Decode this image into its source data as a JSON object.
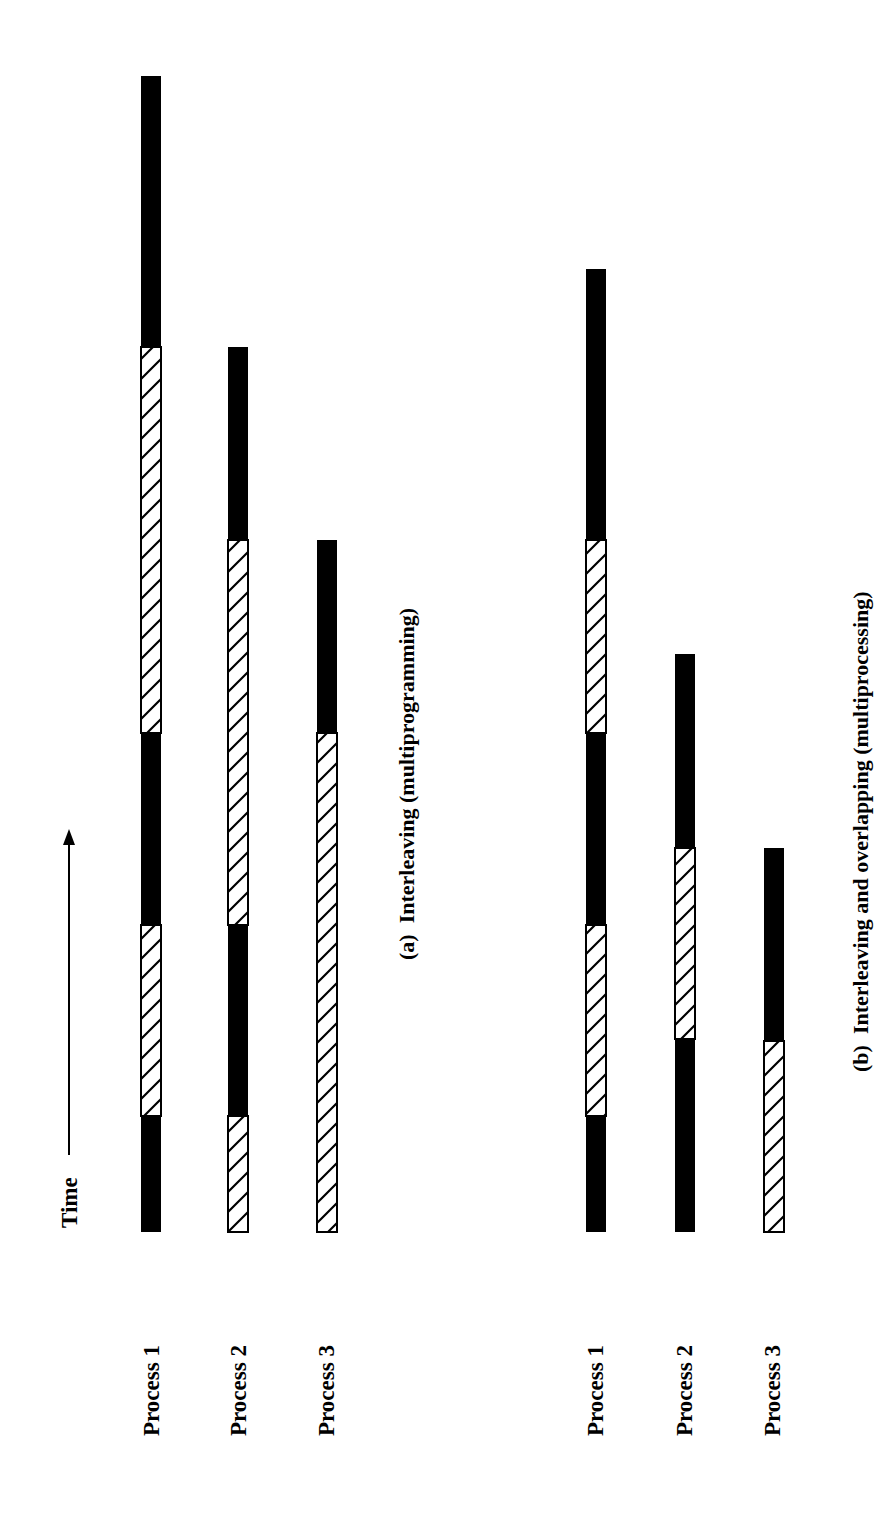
{
  "figure": {
    "time_label": "Time",
    "legend_note": "Solid = running, hatched = blocked/waiting"
  },
  "panels": [
    {
      "id": "a",
      "caption": "(a)  Interleaving (multiprogramming)",
      "processes": [
        {
          "label": "Process 1",
          "segments": [
            {
              "type": "run",
              "from": 1116,
              "to": 1232
            },
            {
              "type": "wait",
              "from": 925,
              "to": 1116
            },
            {
              "type": "run",
              "from": 733,
              "to": 925
            },
            {
              "type": "wait",
              "from": 347,
              "to": 733
            },
            {
              "type": "run",
              "from": 76,
              "to": 347
            }
          ]
        },
        {
          "label": "Process 2",
          "segments": [
            {
              "type": "wait",
              "from": 1116,
              "to": 1232
            },
            {
              "type": "run",
              "from": 925,
              "to": 1116
            },
            {
              "type": "wait",
              "from": 540,
              "to": 925
            },
            {
              "type": "run",
              "from": 347,
              "to": 540
            }
          ]
        },
        {
          "label": "Process 3",
          "segments": [
            {
              "type": "wait",
              "from": 733,
              "to": 1232
            },
            {
              "type": "run",
              "from": 540,
              "to": 733
            }
          ]
        }
      ]
    },
    {
      "id": "b",
      "caption": "(b)  Interleaving and overlapping (multiprocessing)",
      "processes": [
        {
          "label": "Process 1",
          "segments": [
            {
              "type": "run",
              "from": 1116,
              "to": 1232
            },
            {
              "type": "wait",
              "from": 925,
              "to": 1116
            },
            {
              "type": "run",
              "from": 733,
              "to": 925
            },
            {
              "type": "wait",
              "from": 540,
              "to": 733
            },
            {
              "type": "run",
              "from": 269,
              "to": 540
            }
          ]
        },
        {
          "label": "Process 2",
          "segments": [
            {
              "type": "run",
              "from": 1039,
              "to": 1232
            },
            {
              "type": "wait",
              "from": 848,
              "to": 1039
            },
            {
              "type": "run",
              "from": 654,
              "to": 848
            }
          ]
        },
        {
          "label": "Process 3",
          "segments": [
            {
              "type": "wait",
              "from": 1041,
              "to": 1232
            },
            {
              "type": "run",
              "from": 848,
              "to": 1041
            }
          ]
        }
      ]
    }
  ],
  "chart_data": {
    "type": "timeline",
    "orientation": "rotated 90deg counter-clockwise; time increases upward (toward top of page)",
    "time_axis_label": "Time",
    "segment_types": {
      "run": "solid black (executing)",
      "wait": "diagonal hatch (blocked)"
    },
    "units": "page pixels along time axis (bottom = start at 1232)",
    "panels": [
      {
        "caption": "(a) Interleaving (multiprogramming)",
        "series": [
          {
            "name": "Process 1",
            "run": [
              [
                1116,
                1232
              ],
              [
                733,
                925
              ],
              [
                76,
                347
              ]
            ],
            "wait": [
              [
                925,
                1116
              ],
              [
                347,
                733
              ]
            ]
          },
          {
            "name": "Process 2",
            "run": [
              [
                925,
                1116
              ],
              [
                347,
                540
              ]
            ],
            "wait": [
              [
                1116,
                1232
              ],
              [
                540,
                925
              ]
            ]
          },
          {
            "name": "Process 3",
            "run": [
              [
                540,
                733
              ]
            ],
            "wait": [
              [
                733,
                1232
              ]
            ]
          }
        ]
      },
      {
        "caption": "(b) Interleaving and overlapping (multiprocessing)",
        "series": [
          {
            "name": "Process 1",
            "run": [
              [
                1116,
                1232
              ],
              [
                733,
                925
              ],
              [
                269,
                540
              ]
            ],
            "wait": [
              [
                925,
                1116
              ],
              [
                540,
                733
              ]
            ]
          },
          {
            "name": "Process 2",
            "run": [
              [
                1039,
                1232
              ],
              [
                654,
                848
              ]
            ],
            "wait": [
              [
                848,
                1039
              ]
            ]
          },
          {
            "name": "Process 3",
            "run": [
              [
                848,
                1041
              ]
            ],
            "wait": [
              [
                1041,
                1232
              ]
            ]
          }
        ]
      }
    ]
  }
}
